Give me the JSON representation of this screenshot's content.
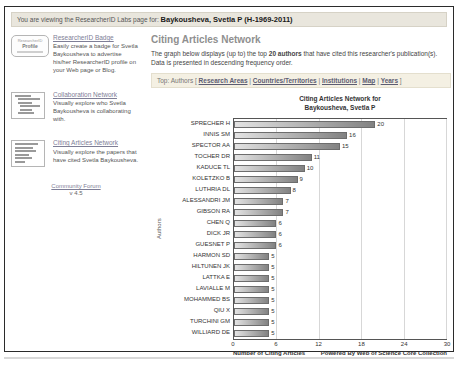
{
  "banner": {
    "prefix": "You are viewing the ResearcherID Labs page for:",
    "researcher": "Baykousheva, Svetla P (H-1969-2011)"
  },
  "sidebar": {
    "badge_card": {
      "title": "ResearcherID Badge",
      "desc": "Easily create a badge for Svetla Baykousheva to advertise his/her ResearcherID profile on your Web page or Blog.",
      "badge_line1": "ResearcherID",
      "badge_line2": "Profile"
    },
    "collab_card": {
      "title": "Collaboration Network",
      "desc": "Visually explore who Svetla Baykousheva is collaborating with."
    },
    "citing_card": {
      "title": "Citing Articles Network",
      "desc": "Visually explore the papers that have cited Svetla Baykousheva."
    },
    "community_forum": "Community Forum",
    "version": "v 4.5"
  },
  "main": {
    "heading": "Citing Articles Network",
    "desc_pre": "The graph below displays (up to) the top ",
    "desc_bold": "20 authors",
    "desc_post": " that have cited this researcher's publication(s). Data is presented in descending frequency order.",
    "nav": {
      "label": "Top:",
      "current": "Authors",
      "open_bracket": "[",
      "sep": "|",
      "close_bracket": "]",
      "links": [
        "Research Areas",
        "Countries/Territories",
        "Institutions",
        "Map",
        "Years"
      ]
    }
  },
  "chart_data": {
    "type": "bar",
    "orientation": "horizontal",
    "title_line1": "Citing Articles Network for",
    "title_line2": "Baykousheva, Svetla P",
    "categories": [
      "SPRECHER H",
      "INNIS SM",
      "SPECTOR AA",
      "TOCHER DR",
      "KADUCE TL",
      "KOLETZKO B",
      "LUTHRIA DL",
      "ALESSANDRI JM",
      "GIBSON RA",
      "CHEN Q",
      "DICK JR",
      "GUESNET P",
      "HARMON SD",
      "HILTUNEN JK",
      "LATTKA E",
      "LAVIALLE M",
      "MOHAMMED BS",
      "QIU X",
      "TURCHINI GM",
      "WILLIARD DE"
    ],
    "values": [
      20,
      16,
      15,
      11,
      10,
      9,
      8,
      7,
      7,
      6,
      6,
      6,
      5,
      5,
      5,
      5,
      5,
      5,
      5,
      5
    ],
    "xlabel": "Number of Citing Articles",
    "ylabel": "Authors",
    "x_ticks": [
      0,
      6,
      12,
      18,
      24,
      30
    ],
    "xlim": [
      0,
      30
    ],
    "grid": true,
    "footer_right": "Powered By Web of Science Core Collection",
    "bar_color_gradient": [
      "#e3e3e3",
      "#828282"
    ]
  }
}
